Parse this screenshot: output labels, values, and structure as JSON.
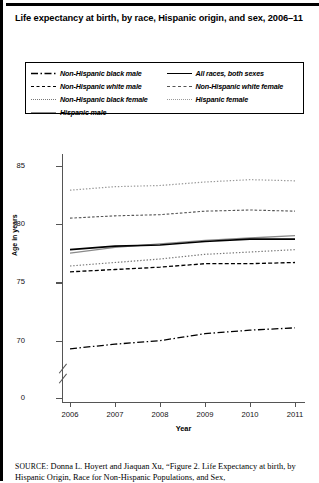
{
  "figure": {
    "title": "Life expectancy at birth, by race, Hispanic origin, and sex, 2006–11",
    "source_prefix": "SOURCE:",
    "source_text": "Donna L. Hoyert and Jiaquan Xu, “Figure 2. Life Expectancy at",
    "source_text_line2": "birth, by Hispanic Origin, Race for Non-Hispanic Populations, and Sex,"
  },
  "chart_data": {
    "type": "line",
    "title": "Life expectancy at birth, by race, Hispanic origin, and sex, 2006–11",
    "xlabel": "Year",
    "ylabel": "Age in years",
    "x": [
      2006,
      2007,
      2008,
      2009,
      2010,
      2011
    ],
    "categories": [
      "2006",
      "2007",
      "2008",
      "2009",
      "2010",
      "2011"
    ],
    "xtick_labels": [
      "2006",
      "2007",
      "2008",
      "2009",
      "2010",
      "2011"
    ],
    "ytick_labels": [
      "0",
      "70",
      "75",
      "80",
      "85"
    ],
    "ylim": [
      68,
      86
    ],
    "ylim_upper_axis": [
      68,
      86
    ],
    "y_axis_break": true,
    "y_axis_break_label": "0",
    "grid": false,
    "legend_position": "top",
    "series": [
      {
        "name": "Non-Hispanic black male",
        "style": "dash-dot",
        "color": "#000000",
        "values": [
          69.3,
          69.7,
          70.0,
          70.6,
          70.9,
          71.1
        ]
      },
      {
        "name": "Non-Hispanic white male",
        "style": "dashed",
        "color": "#000000",
        "values": [
          75.9,
          76.1,
          76.3,
          76.6,
          76.6,
          76.7
        ]
      },
      {
        "name": "Non-Hispanic black female",
        "style": "dotted",
        "color": "#777777",
        "values": [
          76.4,
          76.7,
          77.0,
          77.4,
          77.6,
          77.8
        ]
      },
      {
        "name": "Hispanic male",
        "style": "solid-light",
        "color": "#8a8a8a",
        "values": [
          77.5,
          78.0,
          78.3,
          78.6,
          78.8,
          79.0
        ]
      },
      {
        "name": "All races, both sexes",
        "style": "solid",
        "color": "#000000",
        "values": [
          77.8,
          78.1,
          78.2,
          78.5,
          78.7,
          78.7
        ]
      },
      {
        "name": "Non-Hispanic white female",
        "style": "fine-dash",
        "color": "#555555",
        "values": [
          80.5,
          80.7,
          80.8,
          81.1,
          81.2,
          81.1
        ]
      },
      {
        "name": "Hispanic female",
        "style": "dotted-light",
        "color": "#999999",
        "values": [
          82.9,
          83.2,
          83.3,
          83.6,
          83.8,
          83.7
        ]
      }
    ]
  },
  "legend": {
    "left_column": [
      {
        "label": "Non-Hispanic black male",
        "style": "s-dashdot"
      },
      {
        "label": "Non-Hispanic white male",
        "style": "s-dash"
      },
      {
        "label": "Non-Hispanic black female",
        "style": "s-dot"
      },
      {
        "label": "Hispanic male",
        "style": "s-solid-light"
      }
    ],
    "right_column": [
      {
        "label": "All races, both sexes",
        "style": "s-solid"
      },
      {
        "label": "Non-Hispanic white female",
        "style": "s-finedash"
      },
      {
        "label": "Hispanic female",
        "style": "s-dotlight"
      }
    ]
  }
}
